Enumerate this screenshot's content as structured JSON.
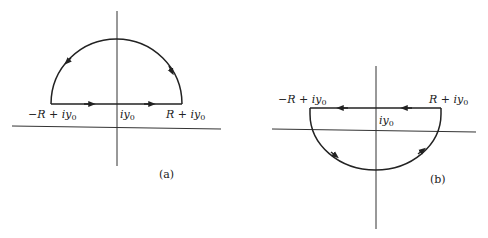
{
  "figures": [
    {
      "id": "a",
      "caption": "(a)",
      "contour": "upper semicircle, counterclockwise",
      "labels": {
        "left": {
          "main": "−R + iy",
          "sub": "0"
        },
        "center": {
          "main": "iy",
          "sub": "0"
        },
        "right": {
          "main": "R + iy",
          "sub": "0"
        }
      }
    },
    {
      "id": "b",
      "caption": "(b)",
      "contour": "lower semicircle, clockwise",
      "labels": {
        "left": {
          "main": "−R + iy",
          "sub": "0"
        },
        "center": {
          "main": "iy",
          "sub": "0"
        },
        "right": {
          "main": "R + iy",
          "sub": "0"
        }
      }
    }
  ],
  "colors": {
    "ink": "#222222",
    "background": "#ffffff"
  }
}
